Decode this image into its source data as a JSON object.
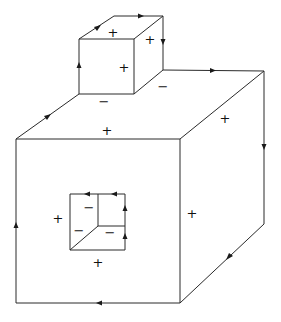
{
  "diagram": {
    "colors": {
      "stroke": "#2a2a2a",
      "text": "#111111",
      "background": "#ffffff"
    },
    "signs": {
      "small_top": "+",
      "small_right": "+",
      "small_front": "+",
      "small_base_front": "−",
      "small_base_right": "−",
      "big_top": "+",
      "big_right": "+",
      "big_front_left": "+",
      "big_front_bottom": "+",
      "hole_top": "−",
      "hole_left": "−",
      "hole_right": "−"
    }
  }
}
